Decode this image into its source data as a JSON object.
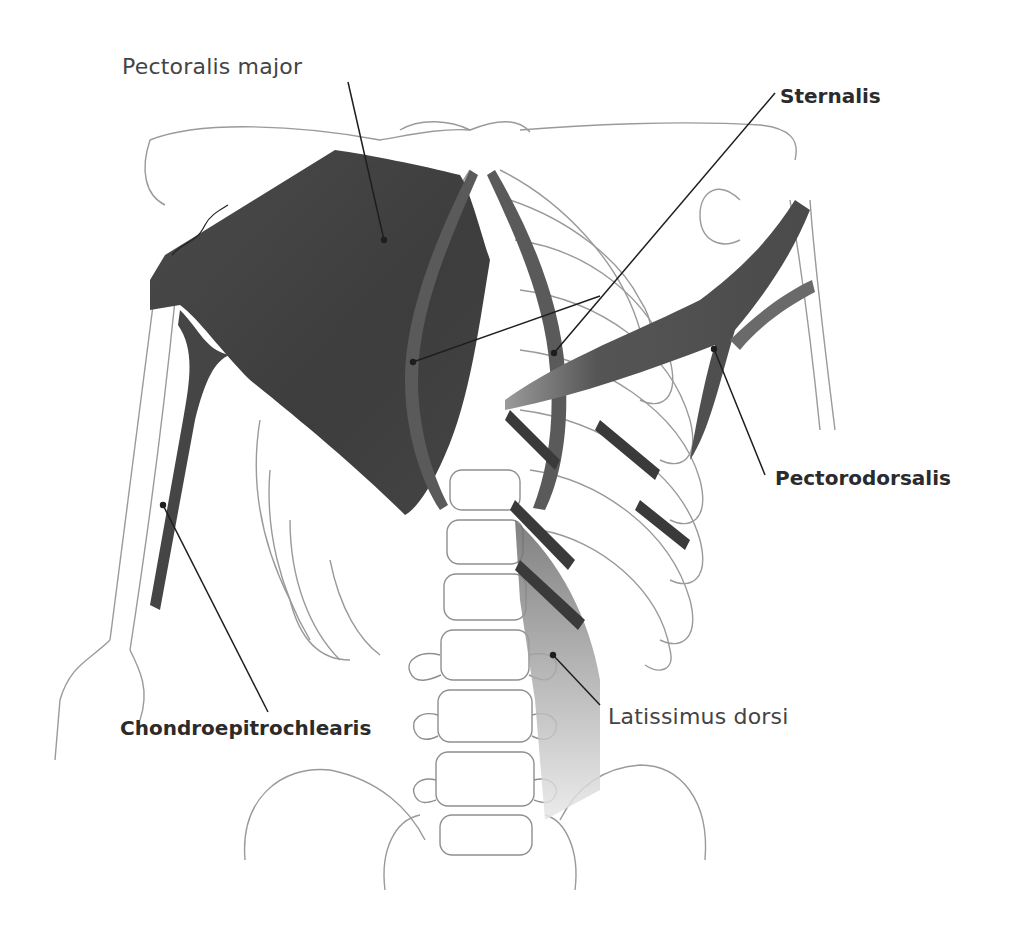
{
  "figure": {
    "signature": "artist signature",
    "colors": {
      "muscle_dark": "#3f3f3f",
      "muscle_mid": "#5a5a5a",
      "bone_outline": "#9a9a9a",
      "leader_line": "#1e1e1e",
      "background": "#ffffff"
    }
  },
  "labels": [
    {
      "id": "pectoralis-major",
      "text": "Pectoralis major",
      "weight": "normal"
    },
    {
      "id": "sternalis",
      "text": "Sternalis",
      "weight": "bold"
    },
    {
      "id": "pectorodorsalis",
      "text": "Pectorodorsalis",
      "weight": "bold"
    },
    {
      "id": "chondroepitrochlearis",
      "text": "Chondroepitrochlearis",
      "weight": "bold"
    },
    {
      "id": "latissimus-dorsi",
      "text": "Latissimus dorsi",
      "weight": "normal"
    }
  ]
}
